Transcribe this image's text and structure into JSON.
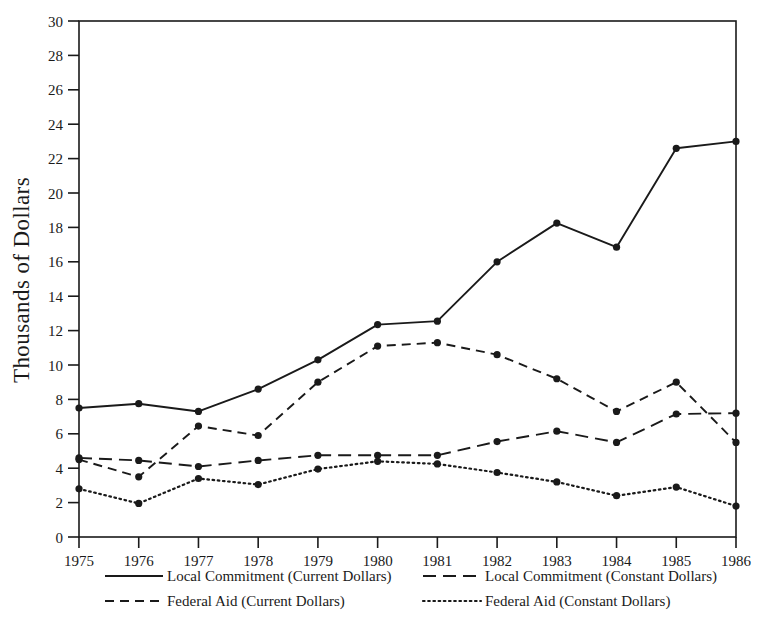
{
  "chart_data": {
    "type": "line",
    "title": "",
    "xlabel": "",
    "ylabel": "Thousands of Dollars",
    "categories": [
      "1975",
      "1976",
      "1977",
      "1978",
      "1979",
      "1980",
      "1981",
      "1982",
      "1983",
      "1984",
      "1985",
      "1986"
    ],
    "x": [
      1975,
      1976,
      1977,
      1978,
      1979,
      1980,
      1981,
      1982,
      1983,
      1984,
      1985,
      1986
    ],
    "xlim": [
      1975,
      1986
    ],
    "ylim": [
      0,
      30
    ],
    "yticks": [
      0,
      2,
      4,
      6,
      8,
      10,
      12,
      14,
      16,
      18,
      20,
      22,
      24,
      26,
      28,
      30
    ],
    "ytick_labels": [
      "0",
      "2",
      "4",
      "6",
      "8",
      "10",
      "12",
      "14",
      "16",
      "18",
      "20",
      "22",
      "24",
      "26",
      "28",
      "30"
    ],
    "grid": false,
    "legend_position": "below-axis",
    "marker": "filled-circle",
    "series": [
      {
        "name": "Local Commitment (Current Dollars)",
        "style": "solid",
        "color": "#1a1a1a",
        "values": [
          7.5,
          7.75,
          7.3,
          8.6,
          10.3,
          12.35,
          12.55,
          16.0,
          18.25,
          16.85,
          22.6,
          23.0
        ]
      },
      {
        "name": "Local Commitment (Constant Dollars)",
        "style": "long-dash",
        "color": "#1a1a1a",
        "values": [
          4.6,
          4.45,
          4.1,
          4.45,
          4.75,
          4.75,
          4.75,
          5.55,
          6.15,
          5.5,
          7.15,
          7.2
        ]
      },
      {
        "name": "Federal Aid (Current Dollars)",
        "style": "dash",
        "color": "#1a1a1a",
        "values": [
          4.5,
          3.5,
          6.45,
          5.9,
          9.0,
          11.1,
          11.3,
          10.6,
          9.2,
          7.3,
          9.0,
          5.5
        ]
      },
      {
        "name": "Federal Aid (Constant Dollars)",
        "style": "dotted",
        "color": "#1a1a1a",
        "values": [
          2.8,
          1.95,
          3.4,
          3.05,
          3.95,
          4.4,
          4.25,
          3.75,
          3.2,
          2.4,
          2.9,
          1.8
        ]
      }
    ]
  },
  "axes": {
    "ylabel": "Thousands of Dollars"
  },
  "legend": {
    "items": [
      {
        "label": "Local Commitment (Current Dollars)",
        "style": "solid"
      },
      {
        "label": "Local Commitment (Constant Dollars)",
        "style": "long-dash"
      },
      {
        "label": "Federal Aid (Current Dollars)",
        "style": "dash"
      },
      {
        "label": "Federal Aid (Constant Dollars)",
        "style": "dotted"
      }
    ]
  }
}
